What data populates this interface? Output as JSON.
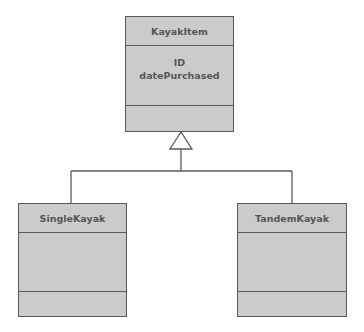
{
  "diagram": {
    "type": "UML class diagram - generalization",
    "classes": [
      {
        "name": "KayakItem",
        "attributes": [
          "ID",
          "datePurchased"
        ],
        "operations": []
      },
      {
        "name": "SingleKayak",
        "attributes": [],
        "operations": []
      },
      {
        "name": "TandemKayak",
        "attributes": [],
        "operations": []
      }
    ],
    "relationships": [
      {
        "type": "generalization",
        "from": "SingleKayak",
        "to": "KayakItem"
      },
      {
        "type": "generalization",
        "from": "TandemKayak",
        "to": "KayakItem"
      }
    ],
    "colors": {
      "box_fill": "#cbcbcb",
      "box_border": "#5a5a5a",
      "text": "#555555",
      "line": "#5a5a5a",
      "background": "#ffffff"
    }
  }
}
